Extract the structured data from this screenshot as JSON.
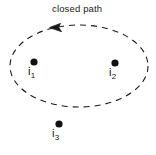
{
  "figure": {
    "width": 156,
    "height": 155,
    "background_color": "#ffffff",
    "stroke_color": "#1a1a1a",
    "annotations": {
      "closed_path_label": "closed path"
    },
    "closed_path": {
      "shape": "ellipse",
      "style": "dashed",
      "center_x": 79,
      "center_y": 66,
      "radius_x": 69,
      "radius_y": 41,
      "dash_pattern": "6 5",
      "stroke_width": 1.1,
      "direction_arrow": {
        "name": "direction-arrow",
        "orientation": "counterclockwise",
        "tip_x": 50,
        "tip_y": 28
      }
    },
    "points": [
      {
        "id": "i1",
        "label_base": "i",
        "label_subscript": "1",
        "dot_x": 34,
        "dot_y": 62,
        "dot_radius": 3.6,
        "inside_path": true
      },
      {
        "id": "i2",
        "label_base": "i",
        "label_subscript": "2",
        "dot_x": 115,
        "dot_y": 63,
        "dot_radius": 3.6,
        "inside_path": true
      },
      {
        "id": "i3",
        "label_base": "i",
        "label_subscript": "3",
        "dot_x": 59,
        "dot_y": 124,
        "dot_radius": 3.6,
        "inside_path": false
      }
    ]
  }
}
